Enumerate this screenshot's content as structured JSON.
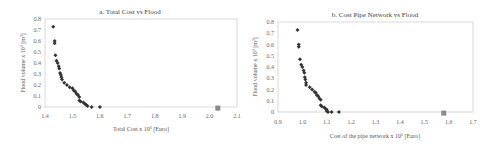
{
  "chart_data": [
    {
      "type": "scatter",
      "title": "a. Total Cost vs Flood",
      "xlabel": "Total Cost x 10^6 [Euro]",
      "ylabel": "Flood volume x 10^3 [m^3]",
      "xlim": [
        1.4,
        2.1
      ],
      "ylim": [
        0,
        0.8
      ],
      "xticks": [
        "1.4",
        "1.5",
        "1.6",
        "1.7",
        "1.8",
        "1.9",
        "2.0",
        "2.1"
      ],
      "yticks": [
        "0",
        "0.1",
        "0.2",
        "0.3",
        "0.4",
        "0.5",
        "0.6",
        "0.7",
        "0.8"
      ],
      "grid": false,
      "legend": null,
      "series": [
        {
          "name": "Pareto solutions",
          "marker": "diamond",
          "color": "#333333",
          "x": [
            1.43,
            1.435,
            1.435,
            1.438,
            1.442,
            1.446,
            1.45,
            1.452,
            1.455,
            1.458,
            1.46,
            1.462,
            1.47,
            1.48,
            1.49,
            1.5,
            1.505,
            1.51,
            1.515,
            1.52,
            1.525,
            1.525,
            1.53,
            1.54,
            1.545,
            1.55,
            1.555,
            1.57,
            1.6
          ],
          "y": [
            0.73,
            0.6,
            0.58,
            0.47,
            0.42,
            0.4,
            0.37,
            0.35,
            0.31,
            0.29,
            0.27,
            0.25,
            0.22,
            0.2,
            0.18,
            0.17,
            0.15,
            0.14,
            0.12,
            0.11,
            0.09,
            0.06,
            0.05,
            0.04,
            0.03,
            0.02,
            0.01,
            0.0,
            0.0
          ]
        },
        {
          "name": "Reference solution",
          "marker": "square",
          "color": "#8a8a8a",
          "x": [
            2.03
          ],
          "y": [
            -0.01
          ]
        }
      ]
    },
    {
      "type": "scatter",
      "title": "b. Cost Pipe Network vs Flood",
      "xlabel": "Cost of the pipe network x 10^6 [Euro]",
      "ylabel": "Flood volume x 10^3 [m^3]",
      "xlim": [
        0.9,
        1.7
      ],
      "ylim": [
        0,
        0.8
      ],
      "xticks": [
        "0.9",
        "1.0",
        "1.1",
        "1.2",
        "1.3",
        "1.4",
        "1.5",
        "1.6",
        "1.7"
      ],
      "yticks": [
        "0",
        "0.1",
        "0.2",
        "0.3",
        "0.4",
        "0.5",
        "0.6",
        "0.7",
        "0.8"
      ],
      "grid": false,
      "legend": null,
      "series": [
        {
          "name": "Pareto solutions",
          "marker": "diamond",
          "color": "#333333",
          "x": [
            0.98,
            0.985,
            0.985,
            0.99,
            0.995,
            1.0,
            1.005,
            1.008,
            1.01,
            1.012,
            1.015,
            1.015,
            1.03,
            1.04,
            1.05,
            1.055,
            1.06,
            1.065,
            1.07,
            1.075,
            1.075,
            1.08,
            1.09,
            1.095,
            1.1,
            1.1,
            1.105,
            1.12,
            1.15
          ],
          "y": [
            0.73,
            0.6,
            0.58,
            0.47,
            0.42,
            0.4,
            0.37,
            0.35,
            0.31,
            0.29,
            0.26,
            0.24,
            0.22,
            0.2,
            0.18,
            0.17,
            0.15,
            0.14,
            0.12,
            0.11,
            0.06,
            0.05,
            0.04,
            0.03,
            0.02,
            0.01,
            0.0,
            0.0,
            0.0
          ]
        },
        {
          "name": "Reference solution",
          "marker": "square",
          "color": "#8a8a8a",
          "x": [
            1.58
          ],
          "y": [
            -0.01
          ]
        }
      ]
    }
  ],
  "charts": {
    "a": {
      "title": "a. Total Cost vs Flood",
      "xlabel": "Total Cost x 10",
      "xlabel_exp": "6",
      "xlabel_unit": " [Euro]",
      "ylabel": "Flood volume x 10",
      "ylabel_exp": "3",
      "ylabel_unit": " [m",
      "ylabel_unit_exp": "3",
      "ylabel_close": "]"
    },
    "b": {
      "title": "b. Cost Pipe Network vs Flood",
      "xlabel": "Cost of the pipe network x 10",
      "xlabel_exp": "6",
      "xlabel_unit": " [Euro]",
      "ylabel": "Flood volume x 10",
      "ylabel_exp": "3",
      "ylabel_unit": " [m",
      "ylabel_unit_exp": "3",
      "ylabel_close": "]"
    }
  }
}
